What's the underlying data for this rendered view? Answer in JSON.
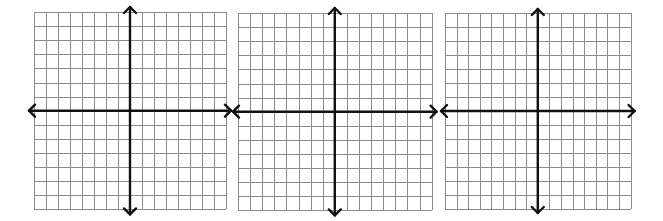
{
  "colors": {
    "background": "#ffffff",
    "grid_line": "#8c8c8c",
    "axis": "#111111"
  },
  "planes": [
    {
      "name": "coordinate-plane-1",
      "grid": {
        "x0": 34,
        "y0": 12,
        "cols": 16,
        "rows": 14,
        "cell_w": 12.0,
        "cell_h": 14.1
      },
      "axis_x_col": 8,
      "axis_y_row": 7,
      "arrow_ext": 5
    },
    {
      "name": "coordinate-plane-2",
      "grid": {
        "x0": 238,
        "y0": 13,
        "cols": 16,
        "rows": 14,
        "cell_w": 12.1,
        "cell_h": 14.1
      },
      "axis_x_col": 8,
      "axis_y_row": 7,
      "arrow_ext": 5
    },
    {
      "name": "coordinate-plane-3",
      "grid": {
        "x0": 445,
        "y0": 13,
        "cols": 16,
        "rows": 14,
        "cell_w": 11.6,
        "cell_h": 14.0
      },
      "axis_x_col": 8,
      "axis_y_row": 7,
      "arrow_ext": 4
    }
  ]
}
